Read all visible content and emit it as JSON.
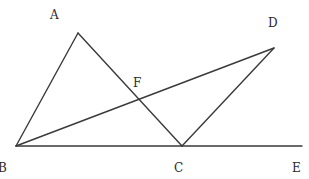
{
  "diagram": {
    "type": "geometry-figure",
    "points": {
      "A": {
        "label": "A",
        "x": 78,
        "y": 33,
        "label_x": 50,
        "label_y": 19
      },
      "B": {
        "label": "B",
        "x": 16,
        "y": 146,
        "label_x": -2,
        "label_y": 172
      },
      "C": {
        "label": "C",
        "x": 182,
        "y": 146,
        "label_x": 174,
        "label_y": 172
      },
      "D": {
        "label": "D",
        "x": 274,
        "y": 48,
        "label_x": 268,
        "label_y": 27
      },
      "E": {
        "label": "E",
        "x": 302,
        "y": 146,
        "label_x": 292,
        "label_y": 172
      },
      "F": {
        "label": "F",
        "x": 139,
        "y": 99,
        "label_x": 133,
        "label_y": 87
      }
    },
    "segments": [
      {
        "from": "A",
        "to": "B"
      },
      {
        "from": "A",
        "to": "C"
      },
      {
        "from": "B",
        "to": "D"
      },
      {
        "from": "C",
        "to": "D"
      },
      {
        "from": "B",
        "to": "E"
      }
    ],
    "intersection": {
      "point": "F",
      "of": [
        "AC",
        "BD"
      ]
    },
    "stroke_color": "#3a3a3a",
    "label_color": "#2a2a2a"
  }
}
